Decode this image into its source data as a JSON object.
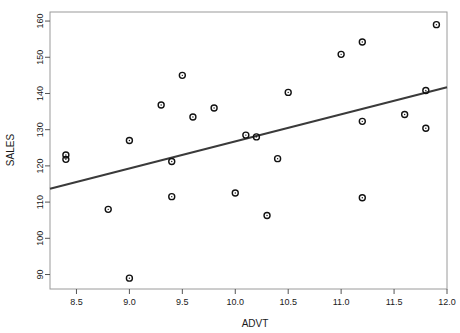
{
  "chart_data": {
    "type": "scatter",
    "title": "",
    "xlabel": "ADVT",
    "ylabel": "SALES",
    "xlim": [
      8.25,
      12.0
    ],
    "ylim": [
      86.0,
      162.5
    ],
    "grid": false,
    "legend": null,
    "point_marker": "open-circle",
    "point_color": "#111111",
    "line_color": "#3a3a3a",
    "x_ticks": [
      8.5,
      9.0,
      9.5,
      10.0,
      10.5,
      11.0,
      11.5,
      12.0
    ],
    "x_tick_labels": [
      "8.5",
      "9.0",
      "9.5",
      "10.0",
      "10.5",
      "11.0",
      "11.5",
      "12.0"
    ],
    "y_ticks": [
      90,
      100,
      110,
      120,
      130,
      140,
      150,
      160
    ],
    "y_tick_labels": [
      "90",
      "100",
      "110",
      "120",
      "130",
      "140",
      "150",
      "160"
    ],
    "points": [
      {
        "x": 8.4,
        "y": 123.0
      },
      {
        "x": 8.4,
        "y": 121.8
      },
      {
        "x": 8.8,
        "y": 108.0
      },
      {
        "x": 9.0,
        "y": 127.0
      },
      {
        "x": 9.0,
        "y": 89.0
      },
      {
        "x": 9.3,
        "y": 136.8
      },
      {
        "x": 9.4,
        "y": 121.2
      },
      {
        "x": 9.4,
        "y": 111.5
      },
      {
        "x": 9.5,
        "y": 145.0
      },
      {
        "x": 9.6,
        "y": 133.5
      },
      {
        "x": 9.8,
        "y": 136.0
      },
      {
        "x": 10.0,
        "y": 112.5
      },
      {
        "x": 10.1,
        "y": 128.5
      },
      {
        "x": 10.2,
        "y": 128.0
      },
      {
        "x": 10.3,
        "y": 106.3
      },
      {
        "x": 10.4,
        "y": 122.0
      },
      {
        "x": 10.5,
        "y": 140.3
      },
      {
        "x": 11.0,
        "y": 150.8
      },
      {
        "x": 11.2,
        "y": 154.2
      },
      {
        "x": 11.2,
        "y": 132.3
      },
      {
        "x": 11.2,
        "y": 111.2
      },
      {
        "x": 11.6,
        "y": 134.2
      },
      {
        "x": 11.8,
        "y": 140.8
      },
      {
        "x": 11.8,
        "y": 130.4
      },
      {
        "x": 11.9,
        "y": 159.0
      }
    ],
    "fit_line": {
      "name": "regression-line",
      "x_start": 8.25,
      "y_start": 113.7,
      "x_end": 12.0,
      "y_end": 141.7
    }
  }
}
